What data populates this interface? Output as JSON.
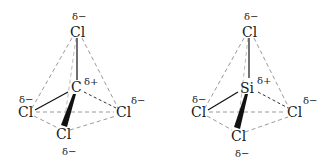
{
  "molecules": [
    {
      "name": "CCl4",
      "center": {
        "symbol": "C",
        "charge": "δ+"
      },
      "ligands": [
        {
          "position": "top",
          "symbol": "Cl",
          "charge": "δ−"
        },
        {
          "position": "left",
          "symbol": "Cl",
          "charge": "δ−"
        },
        {
          "position": "right",
          "symbol": "Cl",
          "charge": "δ−"
        },
        {
          "position": "bottom",
          "symbol": "Cl",
          "charge": "δ−"
        }
      ]
    },
    {
      "name": "SiCl4",
      "center": {
        "symbol": "Si",
        "charge": "δ+"
      },
      "ligands": [
        {
          "position": "top",
          "symbol": "Cl",
          "charge": "δ−"
        },
        {
          "position": "left",
          "symbol": "Cl",
          "charge": "δ−"
        },
        {
          "position": "right",
          "symbol": "Cl",
          "charge": "δ−"
        },
        {
          "position": "bottom",
          "symbol": "Cl",
          "charge": "δ−"
        }
      ]
    }
  ]
}
